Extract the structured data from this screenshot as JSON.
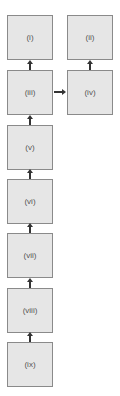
{
  "diagram": {
    "nodes": [
      {
        "id": "i",
        "label": "(i)"
      },
      {
        "id": "ii",
        "label": "(ii)"
      },
      {
        "id": "iii",
        "label": "(iii)"
      },
      {
        "id": "iv",
        "label": "(iv)"
      },
      {
        "id": "v",
        "label": "(v)"
      },
      {
        "id": "vi",
        "label": "(vi)"
      },
      {
        "id": "vii",
        "label": "(vii)"
      },
      {
        "id": "viii",
        "label": "(viii)"
      },
      {
        "id": "ix",
        "label": "(ix)"
      }
    ],
    "edges": [
      {
        "from": "iii",
        "to": "i"
      },
      {
        "from": "iii",
        "to": "iv"
      },
      {
        "from": "iv",
        "to": "ii"
      },
      {
        "from": "v",
        "to": "iii"
      },
      {
        "from": "vi",
        "to": "v"
      },
      {
        "from": "vii",
        "to": "vi"
      },
      {
        "from": "viii",
        "to": "vii"
      },
      {
        "from": "ix",
        "to": "viii"
      }
    ]
  }
}
